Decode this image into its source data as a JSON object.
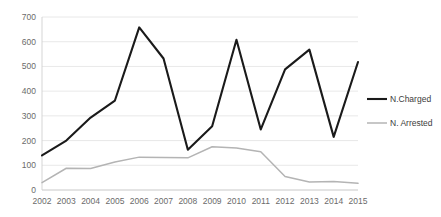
{
  "chart_data": {
    "type": "line",
    "title": "",
    "xlabel": "",
    "ylabel": "",
    "categories": [
      "2002",
      "2003",
      "2004",
      "2005",
      "2006",
      "2007",
      "2008",
      "2009",
      "2010",
      "2011",
      "2012",
      "2013",
      "2014",
      "2015"
    ],
    "series": [
      {
        "name": "N.Charged",
        "color": "#1a1a1a",
        "values": [
          140,
          200,
          293,
          362,
          658,
          532,
          163,
          258,
          608,
          245,
          488,
          568,
          215,
          518
        ]
      },
      {
        "name": "N. Arrested",
        "color": "#b4b4b4",
        "values": [
          30,
          88,
          87,
          113,
          133,
          131,
          130,
          175,
          170,
          155,
          55,
          32,
          34,
          27
        ]
      }
    ],
    "ylim": [
      0,
      700
    ],
    "yticks": [
      0,
      100,
      200,
      300,
      400,
      500,
      600,
      700
    ],
    "ytick_labels": [
      "0",
      "100",
      "200",
      "300",
      "400",
      "500",
      "600",
      "700"
    ],
    "grid": true,
    "legend_position": "right"
  },
  "legend": {
    "items": [
      {
        "label": "N.Charged"
      },
      {
        "label": "N. Arrested"
      }
    ]
  },
  "axes": {
    "y_labels": [
      "700",
      "600",
      "500",
      "400",
      "300",
      "200",
      "100",
      "0"
    ],
    "x_labels": [
      "2002",
      "2003",
      "2004",
      "2005",
      "2006",
      "2007",
      "2008",
      "2009",
      "2010",
      "2011",
      "2012",
      "2013",
      "2014",
      "2015"
    ]
  }
}
